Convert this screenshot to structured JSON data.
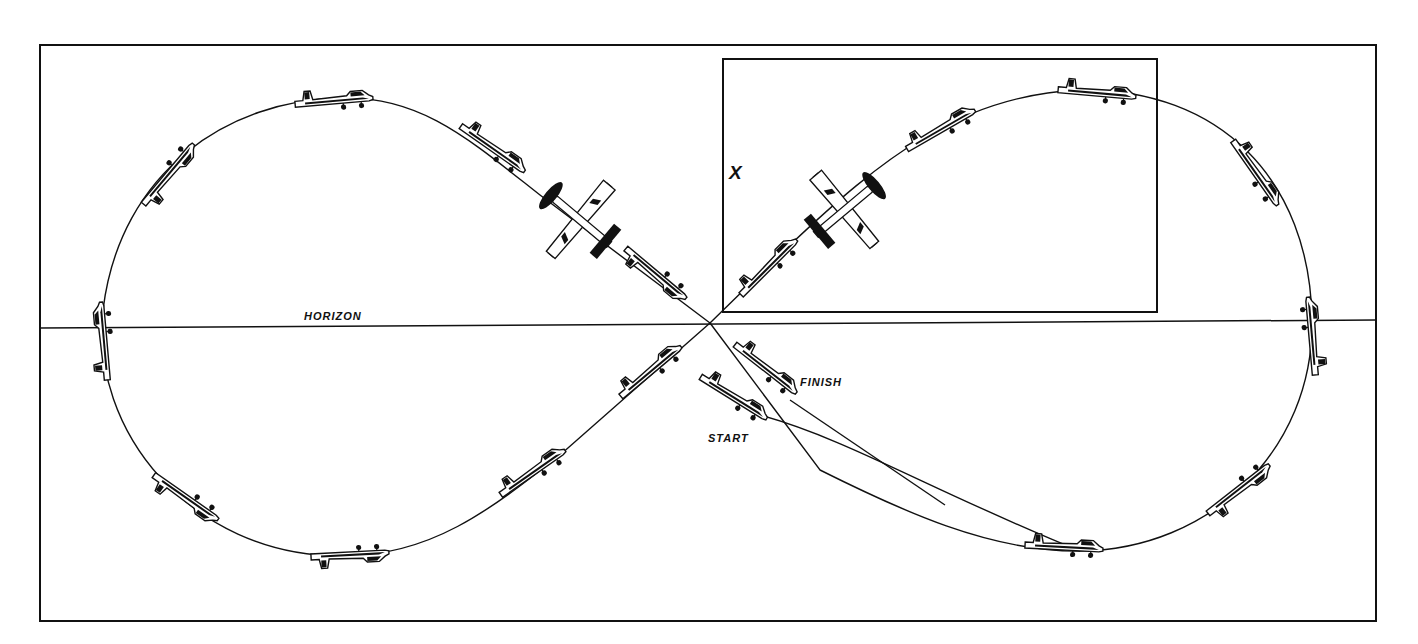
{
  "diagram": {
    "labels": {
      "horizon": "HORIZON",
      "start": "START",
      "finish": "FINISH",
      "reference_point": "X"
    },
    "colors": {
      "ink": "#111111",
      "background": "#ffffff"
    },
    "elements": [
      {
        "name": "outer-frame",
        "type": "rectangle"
      },
      {
        "name": "detail-inset-frame",
        "type": "rectangle",
        "note": "contains point X"
      },
      {
        "name": "horizon-line",
        "type": "line"
      },
      {
        "name": "flight-path",
        "type": "figure-eight curve"
      },
      {
        "name": "airplane-silhouettes",
        "count": 22
      },
      {
        "name": "top-view-airplanes",
        "count": 2
      }
    ]
  }
}
